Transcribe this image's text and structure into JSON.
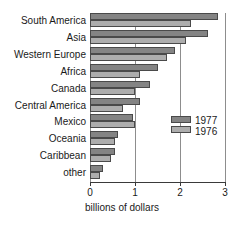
{
  "chart_data": {
    "type": "bar",
    "orientation": "horizontal",
    "title": "",
    "xlabel": "billions of dollars",
    "ylabel": "",
    "xlim": [
      0,
      3
    ],
    "xticks": [
      "0",
      "1",
      "2",
      "3"
    ],
    "grid": true,
    "legend_position": "inside-right",
    "categories": [
      "South America",
      "Asia",
      "Western Europe",
      "Africa",
      "Canada",
      "Central America",
      "Mexico",
      "Oceania",
      "Caribbean",
      "other"
    ],
    "series": [
      {
        "name": "1977",
        "color": "#848484",
        "values": [
          2.85,
          2.62,
          1.88,
          1.52,
          1.33,
          1.1,
          0.96,
          0.63,
          0.55,
          0.28
        ]
      },
      {
        "name": "1976",
        "color": "#adadad",
        "values": [
          2.25,
          2.14,
          1.7,
          1.1,
          1.0,
          0.74,
          1.0,
          0.55,
          0.47,
          0.22
        ]
      }
    ]
  },
  "legend": {
    "entries": [
      {
        "label": "1977",
        "color": "#848484"
      },
      {
        "label": "1976",
        "color": "#adadad"
      }
    ]
  },
  "axis": {
    "x_title": "billions of dollars",
    "tick_labels": [
      "0",
      "1",
      "2",
      "3"
    ]
  }
}
